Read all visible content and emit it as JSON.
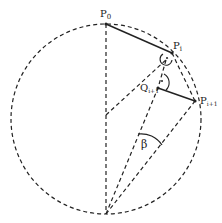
{
  "diagram": {
    "type": "geometry",
    "labels": {
      "p0": "P",
      "p0_sub": "0",
      "pi": "P",
      "pi_sub": "i",
      "qi1": "Q",
      "qi1_sub": "i+1",
      "pi1": "P",
      "pi1_sub": "i+1",
      "beta": "β"
    },
    "colors": {
      "stroke": "#222222",
      "background": "#ffffff"
    }
  }
}
